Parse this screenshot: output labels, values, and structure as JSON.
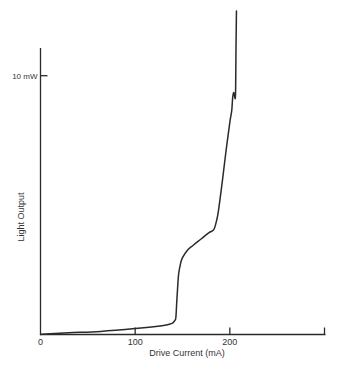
{
  "chart_data": {
    "type": "line",
    "title": "",
    "xlabel": "Drive Current (mA)",
    "ylabel": "Light Output",
    "xlim": [
      0,
      300
    ],
    "ylim": [
      0,
      12.5
    ],
    "grid": false,
    "legend": null,
    "x_ticks": [
      {
        "value": 0,
        "label": "0"
      },
      {
        "value": 100,
        "label": "100"
      },
      {
        "value": 200,
        "label": "200"
      },
      {
        "value": 300,
        "label": ""
      }
    ],
    "y_ticks": [
      {
        "value": 10,
        "label": "10 mW"
      }
    ],
    "series": [
      {
        "name": "Light output vs drive current",
        "color": "#2a2a2a",
        "x": [
          0,
          10,
          30,
          63.5,
          100,
          130,
          138,
          140,
          142,
          143,
          144,
          145,
          146,
          148,
          150,
          155,
          161,
          170,
          178,
          183,
          186,
          188,
          192,
          196,
          200,
          202,
          203,
          204,
          205,
          206,
          206.5,
          207
        ],
        "y": [
          0,
          0.03,
          0.07,
          0.12,
          0.23,
          0.35,
          0.42,
          0.46,
          0.55,
          0.66,
          1.3,
          1.9,
          2.36,
          2.75,
          2.97,
          3.25,
          3.44,
          3.7,
          3.94,
          4.05,
          4.4,
          4.79,
          5.9,
          7.1,
          8.2,
          8.65,
          9.15,
          9.35,
          9.2,
          9.27,
          11.0,
          12.5
        ]
      }
    ]
  }
}
